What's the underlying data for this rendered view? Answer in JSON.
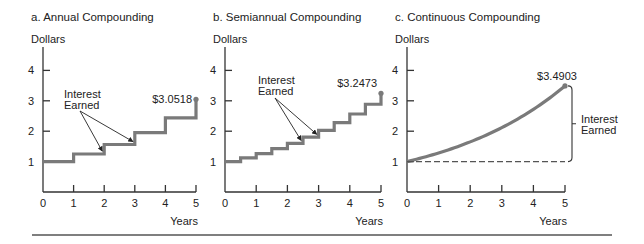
{
  "chart_data": [
    {
      "type": "line",
      "title": "a.  Annual Compounding",
      "ylabel": "Dollars",
      "xlabel": "Years",
      "x_ticks": [
        "0",
        "1",
        "2",
        "3",
        "4",
        "5"
      ],
      "y_ticks": [
        "1",
        "2",
        "3",
        "4"
      ],
      "xlim": [
        0,
        5
      ],
      "ylim": [
        0,
        4.8
      ],
      "step": true,
      "x": [
        0,
        1,
        2,
        3,
        4,
        5
      ],
      "values": [
        1.0,
        1.25,
        1.5625,
        1.9531,
        2.4414,
        3.0518
      ],
      "end_label": "$3.0518",
      "annotation": {
        "text": [
          "Interest",
          "Earned"
        ],
        "arrows_to_x": [
          2,
          3
        ]
      }
    },
    {
      "type": "line",
      "title": "b.  Semiannual Compounding",
      "ylabel": "Dollars",
      "xlabel": "Years",
      "x_ticks": [
        "0",
        "1",
        "2",
        "3",
        "4",
        "5"
      ],
      "y_ticks": [
        "1",
        "2",
        "3",
        "4"
      ],
      "xlim": [
        0,
        5
      ],
      "ylim": [
        0,
        4.8
      ],
      "step": true,
      "x": [
        0,
        0.5,
        1,
        1.5,
        2,
        2.5,
        3,
        3.5,
        4,
        4.5,
        5
      ],
      "values": [
        1.0,
        1.125,
        1.2656,
        1.4238,
        1.6018,
        1.802,
        2.0273,
        2.2807,
        2.5658,
        2.8865,
        3.2473
      ],
      "end_label": "$3.2473",
      "annotation": {
        "text": [
          "Interest",
          "Earned"
        ],
        "arrows_to_x": [
          2.5,
          3
        ]
      }
    },
    {
      "type": "line",
      "title": "c.  Continuous Compounding",
      "ylabel": "Dollars",
      "xlabel": "Years",
      "x_ticks": [
        "0",
        "1",
        "2",
        "3",
        "4",
        "5"
      ],
      "y_ticks": [
        "1",
        "2",
        "3",
        "4"
      ],
      "xlim": [
        0,
        5
      ],
      "ylim": [
        0,
        4.8
      ],
      "step": false,
      "x": [
        0,
        0.5,
        1,
        1.5,
        2,
        2.5,
        3,
        3.5,
        4,
        4.5,
        5
      ],
      "values": [
        1.0,
        1.1331,
        1.284,
        1.455,
        1.6487,
        1.8682,
        2.117,
        2.3989,
        2.7183,
        3.0802,
        3.4903
      ],
      "end_label": "$3.4903",
      "baseline": 1.0,
      "annotation": {
        "text": [
          "Interest",
          "Earned"
        ]
      }
    }
  ]
}
